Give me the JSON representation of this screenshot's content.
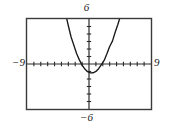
{
  "figure": {
    "kind": "graphing-calculator-viewing-window",
    "background_color": "#ffffff",
    "frame_color": "#3a3a3a",
    "curve_color": "#1a1a1a",
    "axis_color": "#2b2b2b"
  },
  "labels": {
    "ymax": "6",
    "ymin": "−6",
    "xmin": "−9",
    "xmax": "9"
  },
  "chart_data": {
    "type": "line",
    "title": "",
    "subtitle": "",
    "xlabel": "",
    "ylabel": "",
    "xlim": [
      -9,
      9
    ],
    "ylim": [
      -6,
      6
    ],
    "xticks": [
      -8,
      -7,
      -6,
      -5,
      -4,
      -3,
      -2,
      -1,
      0,
      1,
      2,
      3,
      4,
      5,
      6,
      7,
      8
    ],
    "yticks": [
      -5,
      -4,
      -3,
      -2,
      -1,
      0,
      1,
      2,
      3,
      4,
      5
    ],
    "xtick_labels": [
      "-9",
      "9"
    ],
    "ytick_labels": [
      "-6",
      "6"
    ],
    "grid": false,
    "tick_marks": true,
    "legend": false,
    "legend_position": "none",
    "annotations": [],
    "series": [
      {
        "name": "parabola",
        "kind": "quadratic",
        "color": "#1a1a1a",
        "equation": "y = 0.55x^2 - 0.42x - 1.12",
        "vertex": [
          0.38,
          -1.2
        ],
        "roots": [
          -1.08,
          1.84
        ],
        "opens": "up",
        "x": [
          -4.55,
          -4.2,
          -3.8,
          -3.4,
          -3.0,
          -2.6,
          -2.2,
          -1.8,
          -1.4,
          -1.0,
          -0.6,
          -0.2,
          0.2,
          0.6,
          1.0,
          1.4,
          1.8,
          2.2,
          2.6,
          3.0,
          3.4,
          3.8,
          4.2,
          4.6,
          4.9
        ],
        "y": [
          12.2,
          10.4,
          8.5,
          6.7,
          5.1,
          3.6,
          2.5,
          1.4,
          0.55,
          -0.15,
          -0.67,
          -1.02,
          -1.18,
          -1.17,
          -0.99,
          -0.63,
          -0.09,
          0.47,
          1.36,
          2.33,
          3.05,
          4.23,
          5.3,
          6.5,
          7.5
        ]
      }
    ]
  }
}
